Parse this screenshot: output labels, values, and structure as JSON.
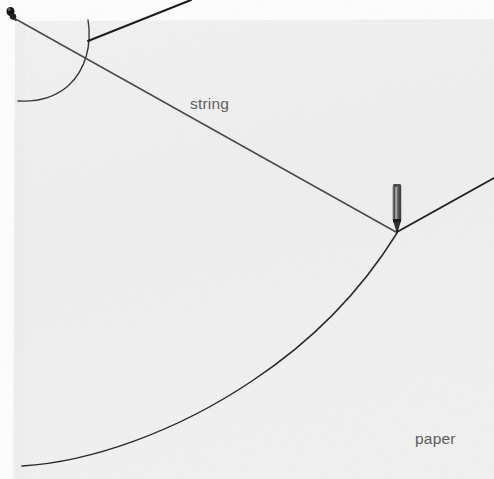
{
  "figure": {
    "canvas": {
      "width": 494,
      "height": 479
    },
    "colors": {
      "page_background": "#ffffff",
      "paper_background": "#f0f0f0",
      "paper_background_light": "#f7f7f7",
      "ink_dark": "#1d1d1d",
      "ink_mid": "#4a4a4a",
      "ink_light": "#7c7c7c",
      "label_text": "#5d5d5d",
      "pencil_body": "#5a5a5a",
      "pencil_tip": "#151515"
    },
    "labels": [
      {
        "id": "string",
        "text": "string",
        "x": 190,
        "y": 95
      },
      {
        "id": "paper",
        "text": "paper",
        "x": 415,
        "y": 430
      }
    ],
    "objects": [
      {
        "name": "pin-tack",
        "type": "marker",
        "x": 11,
        "y": 14
      },
      {
        "name": "pencil",
        "type": "tool",
        "x": 397,
        "y": 208,
        "tip_x": 397,
        "tip_y": 233
      },
      {
        "name": "string-segment-left",
        "type": "line",
        "from": [
          11,
          16
        ],
        "to": [
          396,
          232
        ]
      },
      {
        "name": "string-segment-right",
        "type": "line",
        "from": [
          397,
          231
        ],
        "to": [
          494,
          178
        ]
      },
      {
        "name": "string-segment-top",
        "type": "line",
        "from": [
          190,
          0
        ],
        "to": [
          90,
          40
        ]
      },
      {
        "name": "ellipse-arc-major",
        "type": "arc",
        "from": [
          22,
          466
        ],
        "to": [
          397,
          233
        ]
      },
      {
        "name": "ellipse-arc-minor",
        "type": "arc",
        "from": [
          88,
          20
        ],
        "to": [
          18,
          101
        ]
      }
    ],
    "paper_edges": {
      "left_x": 15,
      "top_y": 21,
      "right_x": 494,
      "bottom_y": 479
    }
  }
}
